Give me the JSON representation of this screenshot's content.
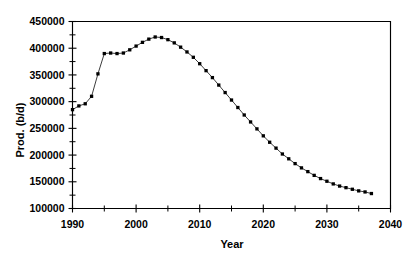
{
  "chart_data": {
    "type": "line",
    "title": "",
    "xlabel": "Year",
    "ylabel": "Prod. (b/d)",
    "xlim": [
      1990,
      2040
    ],
    "ylim": [
      100000,
      450000
    ],
    "grid": false,
    "legend": null,
    "x_ticks_major": [
      1990,
      2000,
      2010,
      2020,
      2030,
      2040
    ],
    "x_tick_labels": [
      "1990",
      "2000",
      "2010",
      "2020",
      "2030",
      "2040"
    ],
    "x_ticks_minor": [
      1995,
      2005,
      2015,
      2025,
      2035
    ],
    "y_ticks_major": [
      100000,
      150000,
      200000,
      250000,
      300000,
      350000,
      400000,
      450000
    ],
    "y_tick_labels": [
      "100000",
      "150000",
      "200000",
      "250000",
      "300000",
      "350000",
      "400000",
      "450000"
    ],
    "y_ticks_minor": [
      125000,
      175000,
      225000,
      275000,
      325000,
      375000,
      425000
    ],
    "marker": "square",
    "series": [
      {
        "name": "Production",
        "x": [
          1990,
          1991,
          1992,
          1993,
          1994,
          1995,
          1996,
          1997,
          1998,
          1999,
          2000,
          2001,
          2002,
          2003,
          2004,
          2005,
          2006,
          2007,
          2008,
          2009,
          2010,
          2011,
          2012,
          2013,
          2014,
          2015,
          2016,
          2017,
          2018,
          2019,
          2020,
          2021,
          2022,
          2023,
          2024,
          2025,
          2026,
          2027,
          2028,
          2029,
          2030,
          2031,
          2032,
          2033,
          2034,
          2035,
          2036,
          2037
        ],
        "values": [
          285000,
          292000,
          296000,
          310000,
          352000,
          390000,
          391000,
          390000,
          391000,
          397000,
          404000,
          411000,
          417000,
          421000,
          420000,
          416000,
          410000,
          402000,
          393000,
          383000,
          371000,
          358000,
          345000,
          331000,
          317000,
          303000,
          289000,
          275000,
          262000,
          249000,
          236000,
          224000,
          213000,
          202000,
          193000,
          184000,
          176000,
          169000,
          162000,
          156000,
          151000,
          146000,
          142000,
          139000,
          136000,
          133000,
          131000,
          128000
        ]
      }
    ]
  }
}
